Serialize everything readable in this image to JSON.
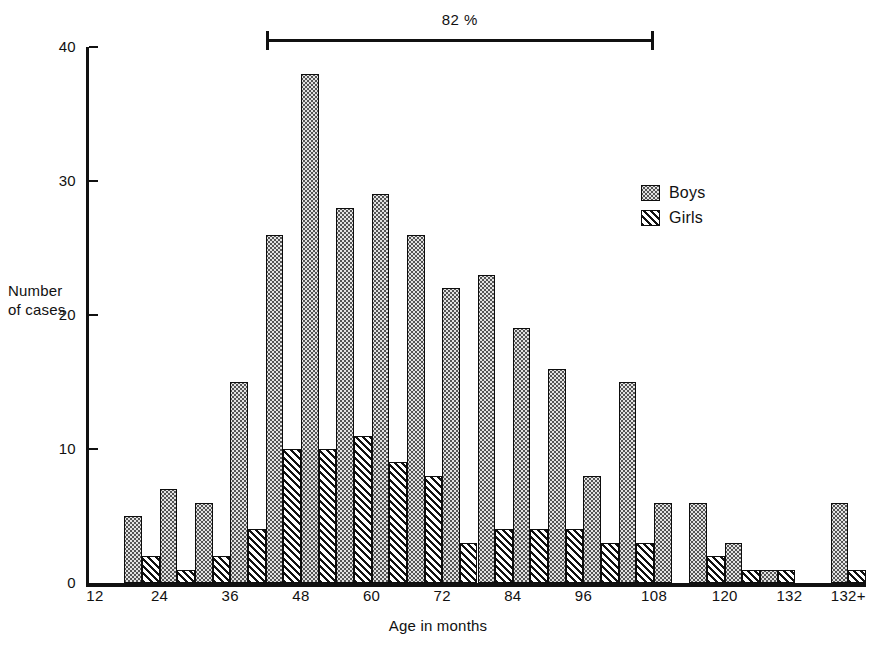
{
  "chart_data": {
    "type": "bar",
    "title": "",
    "xlabel": "Age in months",
    "ylabel": "Number\nof cases",
    "ylim": [
      0,
      40
    ],
    "yticks": [
      0,
      10,
      20,
      30,
      40
    ],
    "xlim": [
      12,
      144
    ],
    "xticks": [
      12,
      24,
      36,
      48,
      60,
      72,
      84,
      96,
      108,
      120,
      132,
      144
    ],
    "xtick_labels": [
      "12",
      "24",
      "36",
      "48",
      "60",
      "72",
      "84",
      "96",
      "108",
      "120",
      "132",
      "132+"
    ],
    "grid": false,
    "legend_position": "upper-right",
    "bin_width_months": 6,
    "bin_starts": [
      18,
      24,
      30,
      36,
      42,
      48,
      54,
      60,
      66,
      72,
      78,
      84,
      90,
      96,
      102,
      108,
      114,
      120,
      126,
      132,
      138
    ],
    "categories": [
      "18-24",
      "24-30",
      "30-36",
      "36-42",
      "42-48",
      "48-54",
      "54-60",
      "60-66",
      "66-72",
      "72-78",
      "78-84",
      "84-90",
      "90-96",
      "96-102",
      "102-108",
      "108-114",
      "114-120",
      "120-126",
      "126-132",
      "132",
      "132+"
    ],
    "series": [
      {
        "name": "Boys",
        "pattern": "stipple",
        "values": [
          5,
          7,
          6,
          15,
          26,
          38,
          28,
          29,
          26,
          22,
          23,
          19,
          16,
          8,
          15,
          6,
          6,
          3,
          1,
          0,
          6
        ]
      },
      {
        "name": "Girls",
        "pattern": "hatch",
        "values": [
          2,
          1,
          2,
          4,
          10,
          10,
          11,
          9,
          8,
          3,
          4,
          4,
          4,
          3,
          3,
          0,
          2,
          1,
          1,
          0,
          1
        ]
      }
    ],
    "annotation": {
      "label": "82 %",
      "span_start_month": 42,
      "span_end_month": 108
    }
  },
  "axis": {
    "ylabel": "Number\nof cases",
    "xlabel": "Age in months",
    "ytick_labels": [
      "0",
      "10",
      "20",
      "30",
      "40"
    ],
    "xtick_labels": [
      "12",
      "24",
      "36",
      "48",
      "60",
      "72",
      "84",
      "96",
      "108",
      "120",
      "132",
      "132+"
    ]
  },
  "legend": {
    "items": [
      {
        "label": "Boys",
        "pattern": "stipple"
      },
      {
        "label": "Girls",
        "pattern": "hatch"
      }
    ]
  },
  "annotation": {
    "label": "82 %"
  },
  "colors": {
    "ink": "#111111",
    "boys_fill": "#e3e3e3",
    "girls_fill": "#f2f2f2",
    "background": "#ffffff"
  }
}
